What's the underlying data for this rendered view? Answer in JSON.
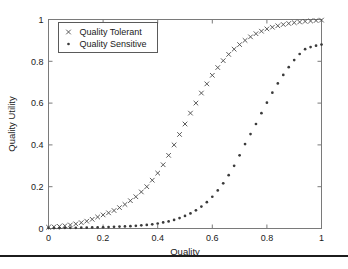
{
  "figure": {
    "background_color": "#ffffff",
    "axes_border_color": "#7a7a7a",
    "bottom_rule_color": "#1c1c1c"
  },
  "chart_data": {
    "type": "scatter",
    "title": "",
    "xlabel": "Quality",
    "ylabel": "Quality Utility",
    "xlim": [
      0,
      1
    ],
    "ylim": [
      0,
      1
    ],
    "xticks": [
      0,
      0.2,
      0.4,
      0.6,
      0.8,
      1
    ],
    "xticklabels": [
      "0",
      "0.2",
      "0.4",
      "0.6",
      "0.8",
      "1"
    ],
    "yticks": [
      0,
      0.2,
      0.4,
      0.6,
      0.8,
      1
    ],
    "yticklabels": [
      "0",
      "0.2",
      "0.4",
      "0.6",
      "0.8",
      "1"
    ],
    "grid": false,
    "legend_position": "upper left",
    "legend_entries": [
      "Quality Tolerant",
      "Quality Sensitive"
    ],
    "x": [
      0.0,
      0.02,
      0.04,
      0.06,
      0.08,
      0.1,
      0.12,
      0.14,
      0.16,
      0.18,
      0.2,
      0.22,
      0.24,
      0.26,
      0.28,
      0.3,
      0.32,
      0.34,
      0.36,
      0.38,
      0.4,
      0.42,
      0.44,
      0.46,
      0.48,
      0.5,
      0.52,
      0.54,
      0.56,
      0.58,
      0.6,
      0.62,
      0.64,
      0.66,
      0.68,
      0.7,
      0.72,
      0.74,
      0.76,
      0.78,
      0.8,
      0.82,
      0.84,
      0.86,
      0.88,
      0.9,
      0.92,
      0.94,
      0.96,
      0.98,
      1.0
    ],
    "series": [
      {
        "name": "Quality Tolerant",
        "marker": "x",
        "color": "#4a4a4a",
        "values": [
          0.006,
          0.008,
          0.01,
          0.013,
          0.017,
          0.022,
          0.028,
          0.035,
          0.044,
          0.055,
          0.065,
          0.075,
          0.086,
          0.1,
          0.115,
          0.133,
          0.152,
          0.175,
          0.2,
          0.231,
          0.265,
          0.305,
          0.35,
          0.4,
          0.45,
          0.5,
          0.552,
          0.6,
          0.648,
          0.692,
          0.733,
          0.77,
          0.803,
          0.833,
          0.858,
          0.88,
          0.9,
          0.917,
          0.932,
          0.944,
          0.955,
          0.963,
          0.97,
          0.976,
          0.981,
          0.985,
          0.988,
          0.991,
          0.993,
          0.995,
          0.997
        ]
      },
      {
        "name": "Quality Sensitive",
        "marker": ".",
        "color": "#3a3a3a",
        "values": [
          0.002,
          0.002,
          0.002,
          0.003,
          0.003,
          0.003,
          0.004,
          0.004,
          0.005,
          0.005,
          0.006,
          0.007,
          0.008,
          0.009,
          0.01,
          0.011,
          0.013,
          0.015,
          0.017,
          0.02,
          0.024,
          0.029,
          0.034,
          0.041,
          0.05,
          0.06,
          0.072,
          0.087,
          0.105,
          0.126,
          0.152,
          0.182,
          0.216,
          0.255,
          0.3,
          0.35,
          0.404,
          0.452,
          0.5,
          0.552,
          0.602,
          0.65,
          0.694,
          0.735,
          0.772,
          0.806,
          0.835,
          0.858,
          0.868,
          0.875,
          0.88
        ]
      }
    ]
  }
}
